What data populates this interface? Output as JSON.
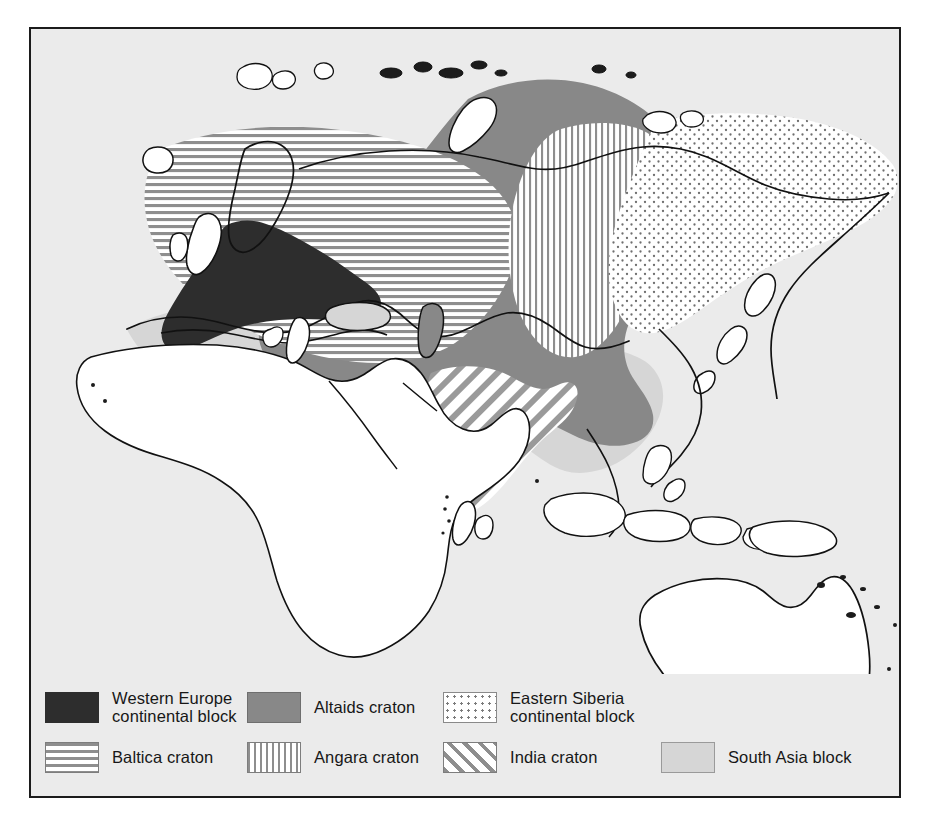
{
  "figure": {
    "background_color": "#ebebeb",
    "frame_color": "#1b1b1b",
    "land_outline_color": "#111111",
    "unshaded_land_color": "#ffffff"
  },
  "legend": {
    "rows": [
      [
        {
          "key": "western-europe",
          "label": "Western Europe\ncontinental block",
          "pattern": "solid-dark",
          "color": "#2d2d2d"
        },
        {
          "key": "altaids",
          "label": "Altaids craton",
          "pattern": "solid-mid",
          "color": "#888888"
        },
        {
          "key": "eastern-siberia",
          "label": "Eastern Siberia\ncontinental block",
          "pattern": "dots",
          "color": "#7a7a7a"
        }
      ],
      [
        {
          "key": "baltica",
          "label": "Baltica craton",
          "pattern": "horizontal-stripes",
          "color": "#8e8e8e"
        },
        {
          "key": "angara",
          "label": "Angara craton",
          "pattern": "vertical-stripes",
          "color": "#8e8e8e"
        },
        {
          "key": "india",
          "label": "India craton",
          "pattern": "diagonal-stripes",
          "color": "#8e8e8e"
        },
        {
          "key": "south-asia",
          "label": "South Asia block",
          "pattern": "solid-light",
          "color": "#d6d6d6"
        }
      ]
    ]
  },
  "map_regions": [
    {
      "key": "western-europe",
      "name": "Western Europe continental block",
      "pattern": "solid-dark"
    },
    {
      "key": "baltica",
      "name": "Baltica craton",
      "pattern": "horizontal-stripes"
    },
    {
      "key": "altaids",
      "name": "Altaids craton",
      "pattern": "solid-mid"
    },
    {
      "key": "angara",
      "name": "Angara craton",
      "pattern": "vertical-stripes"
    },
    {
      "key": "eastern-siberia",
      "name": "Eastern Siberia continental block",
      "pattern": "dots"
    },
    {
      "key": "india",
      "name": "India craton",
      "pattern": "diagonal-stripes"
    },
    {
      "key": "south-asia",
      "name": "South Asia block",
      "pattern": "solid-light"
    }
  ]
}
